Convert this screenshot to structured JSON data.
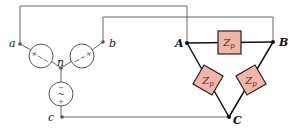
{
  "diagram": {
    "type": "Y-connected source feeding delta-connected load",
    "source": {
      "terminals": [
        "a",
        "b",
        "c"
      ],
      "neutral": "n",
      "source_symbol": "~",
      "polarity_marks": [
        "+",
        "-"
      ]
    },
    "load": {
      "nodes": [
        "A",
        "B",
        "C"
      ],
      "impedance_label": "Z",
      "impedance_subscript": "p",
      "impedance_count": 3,
      "impedance_fill": "#f3b5a8"
    },
    "connections": [
      {
        "from": "a",
        "to": "A"
      },
      {
        "from": "b",
        "to": "B"
      },
      {
        "from": "c",
        "to": "C"
      }
    ]
  }
}
